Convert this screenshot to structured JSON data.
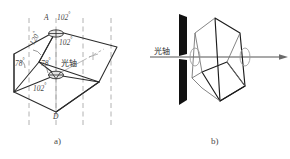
{
  "figure": {
    "title_alt": "Calcite rhombohedron and optical axis diagram",
    "panel_a": {
      "caption": "a)",
      "optic_axis_label": "光轴",
      "vertex_top_label": "A",
      "vertex_bottom_label": "D",
      "angles": [
        {
          "id": "top-right-102",
          "text": "102",
          "unit": "°"
        },
        {
          "id": "inner-102",
          "text": "102",
          "unit": "°"
        },
        {
          "id": "edge-120",
          "text": "120",
          "unit": "°"
        },
        {
          "id": "left-78",
          "text": "78",
          "unit": "°"
        },
        {
          "id": "mid-78",
          "text": "78",
          "unit": "°"
        },
        {
          "id": "bottom-102",
          "text": "102",
          "unit": "°"
        }
      ],
      "colors": {
        "outline": "#2b2b2b",
        "dashed": "#9a9a9a",
        "thin": "#7d7d7d"
      }
    },
    "panel_b": {
      "caption": "b)",
      "optic_axis_label": "光轴",
      "slit_label": "slit",
      "colors": {
        "outline": "#1c1c1c",
        "barrier": "#111111",
        "axis": "#8d8d8d",
        "thin": "#b0b0b0"
      }
    }
  }
}
